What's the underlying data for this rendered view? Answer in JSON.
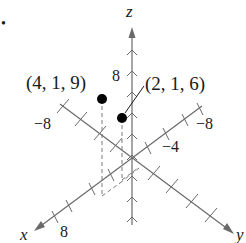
{
  "figure": {
    "bullet": "•",
    "axes": {
      "x_label": "x",
      "y_label": "y",
      "z_label": "z"
    },
    "tick_labels": {
      "x_pos": "8",
      "x_neg": "−8",
      "y_neg_outer": "−8",
      "y_neg_inner": "−4",
      "z_pos": "8"
    },
    "points": [
      {
        "label": "(4, 1, 9)",
        "x": 4,
        "y": 1,
        "z": 9
      },
      {
        "label": "(2, 1, 6)",
        "x": 2,
        "y": 1,
        "z": 6
      }
    ],
    "colors": {
      "axis": "#6a6a6a",
      "point": "#000000",
      "text": "#1a1a1a"
    }
  }
}
